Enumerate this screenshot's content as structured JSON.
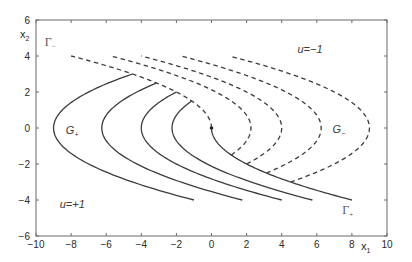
{
  "chart_data": {
    "type": "line",
    "title": "",
    "xlabel": "x1",
    "ylabel": "x2",
    "xlim": [
      -10,
      10
    ],
    "ylim": [
      -6,
      6
    ],
    "xticks": [
      -10,
      -8,
      -6,
      -4,
      -2,
      0,
      2,
      4,
      6,
      8,
      10
    ],
    "yticks": [
      -6,
      -4,
      -2,
      0,
      2,
      4,
      6
    ],
    "xtick_labels": [
      "-10",
      "-8",
      "-6",
      "-4",
      "-2",
      "0",
      "2",
      "4",
      "6",
      "8",
      "10"
    ],
    "ytick_labels": [
      "-6",
      "-4",
      "-2",
      "0",
      "2",
      "4",
      "6"
    ],
    "grid": false,
    "legend": null,
    "series": [
      {
        "name": "u=+1 trajectory (c=-9)",
        "style": "solid",
        "equation": "x1 = x2^2/2 + c",
        "c": -9,
        "x2_range": [
          -4,
          3
        ],
        "points": [
          [
            -1,
            -4
          ],
          [
            -2.875,
            -3.5
          ],
          [
            -4.5,
            -3
          ],
          [
            -5.875,
            -2.5
          ],
          [
            -7,
            -2
          ],
          [
            -7.875,
            -1.5
          ],
          [
            -8.5,
            -1
          ],
          [
            -8.875,
            -0.5
          ],
          [
            -9,
            0
          ],
          [
            -8.875,
            0.5
          ],
          [
            -8.5,
            1
          ],
          [
            -7.875,
            1.5
          ],
          [
            -7,
            2
          ],
          [
            -5.875,
            2.5
          ],
          [
            -4.5,
            3
          ]
        ]
      },
      {
        "name": "u=+1 trajectory (c=-6.25)",
        "style": "solid",
        "equation": "x1 = x2^2/2 + c",
        "c": -6.25,
        "x2_range": [
          -4,
          2.5
        ],
        "points": [
          [
            1.75,
            -4
          ],
          [
            -0.125,
            -3.5
          ],
          [
            -1.75,
            -3
          ],
          [
            -3.125,
            -2.5
          ],
          [
            -4.25,
            -2
          ],
          [
            -5.125,
            -1.5
          ],
          [
            -5.75,
            -1
          ],
          [
            -6.125,
            -0.5
          ],
          [
            -6.25,
            0
          ],
          [
            -6.125,
            0.5
          ],
          [
            -5.75,
            1
          ],
          [
            -5.125,
            1.5
          ],
          [
            -4.25,
            2
          ],
          [
            -3.125,
            2.5
          ]
        ]
      },
      {
        "name": "u=+1 trajectory (c=-4)",
        "style": "solid",
        "equation": "x1 = x2^2/2 + c",
        "c": -4,
        "x2_range": [
          -4,
          2
        ],
        "points": [
          [
            4,
            -4
          ],
          [
            2.125,
            -3.5
          ],
          [
            0.5,
            -3
          ],
          [
            -0.875,
            -2.5
          ],
          [
            -2,
            -2
          ],
          [
            -2.875,
            -1.5
          ],
          [
            -3.5,
            -1
          ],
          [
            -3.875,
            -0.5
          ],
          [
            -4,
            0
          ],
          [
            -3.875,
            0.5
          ],
          [
            -3.5,
            1
          ],
          [
            -2.875,
            1.5
          ],
          [
            -2,
            2
          ]
        ]
      },
      {
        "name": "u=+1 trajectory (c=-2.25)",
        "style": "solid",
        "equation": "x1 = x2^2/2 + c",
        "c": -2.25,
        "x2_range": [
          -4,
          1.5
        ],
        "points": [
          [
            5.75,
            -4
          ],
          [
            3.875,
            -3.5
          ],
          [
            2.25,
            -3
          ],
          [
            0.875,
            -2.5
          ],
          [
            -0.25,
            -2
          ],
          [
            -1.125,
            -1.5
          ],
          [
            -1.75,
            -1
          ],
          [
            -2.125,
            -0.5
          ],
          [
            -2.25,
            0
          ],
          [
            -2.125,
            0.5
          ],
          [
            -1.75,
            1
          ],
          [
            -1.125,
            1.5
          ]
        ]
      },
      {
        "name": "Gamma+ switching curve",
        "style": "solid",
        "equation": "x1 = x2^2/2 + c",
        "c": 0,
        "x2_range": [
          -4,
          0
        ],
        "points": [
          [
            8,
            -4
          ],
          [
            6.125,
            -3.5
          ],
          [
            4.5,
            -3
          ],
          [
            3.125,
            -2.5
          ],
          [
            2,
            -2
          ],
          [
            1.125,
            -1.5
          ],
          [
            0.5,
            -1
          ],
          [
            0.125,
            -0.5
          ],
          [
            0,
            0
          ]
        ]
      },
      {
        "name": "u=-1 trajectory (c=9)",
        "style": "dashed",
        "equation": "x1 = -x2^2/2 + c",
        "c": 9,
        "x2_range": [
          -3,
          4
        ],
        "points": [
          [
            4.5,
            -3
          ],
          [
            5.875,
            -2.5
          ],
          [
            7,
            -2
          ],
          [
            7.875,
            -1.5
          ],
          [
            8.5,
            -1
          ],
          [
            8.875,
            -0.5
          ],
          [
            9,
            0
          ],
          [
            8.875,
            0.5
          ],
          [
            8.5,
            1
          ],
          [
            7.875,
            1.5
          ],
          [
            7,
            2
          ],
          [
            5.875,
            2.5
          ],
          [
            4.5,
            3
          ],
          [
            2.875,
            3.5
          ],
          [
            1,
            4
          ]
        ]
      },
      {
        "name": "u=-1 trajectory (c=6.25)",
        "style": "dashed",
        "equation": "x1 = -x2^2/2 + c",
        "c": 6.25,
        "x2_range": [
          -2.5,
          4
        ],
        "points": [
          [
            3.125,
            -2.5
          ],
          [
            4.25,
            -2
          ],
          [
            5.125,
            -1.5
          ],
          [
            5.75,
            -1
          ],
          [
            6.125,
            -0.5
          ],
          [
            6.25,
            0
          ],
          [
            6.125,
            0.5
          ],
          [
            5.75,
            1
          ],
          [
            5.125,
            1.5
          ],
          [
            4.25,
            2
          ],
          [
            3.125,
            2.5
          ],
          [
            1.75,
            3
          ],
          [
            0.125,
            3.5
          ],
          [
            -1.75,
            4
          ]
        ]
      },
      {
        "name": "u=-1 trajectory (c=4)",
        "style": "dashed",
        "equation": "x1 = -x2^2/2 + c",
        "c": 4,
        "x2_range": [
          -2,
          4
        ],
        "points": [
          [
            2,
            -2
          ],
          [
            2.875,
            -1.5
          ],
          [
            3.5,
            -1
          ],
          [
            3.875,
            -0.5
          ],
          [
            4,
            0
          ],
          [
            3.875,
            0.5
          ],
          [
            3.5,
            1
          ],
          [
            2.875,
            1.5
          ],
          [
            2,
            2
          ],
          [
            0.875,
            2.5
          ],
          [
            -0.5,
            3
          ],
          [
            -2.125,
            3.5
          ],
          [
            -4,
            4
          ]
        ]
      },
      {
        "name": "u=-1 trajectory (c=2.25)",
        "style": "dashed",
        "equation": "x1 = -x2^2/2 + c",
        "c": 2.25,
        "x2_range": [
          -1.5,
          4
        ],
        "points": [
          [
            1.125,
            -1.5
          ],
          [
            1.75,
            -1
          ],
          [
            2.125,
            -0.5
          ],
          [
            2.25,
            0
          ],
          [
            2.125,
            0.5
          ],
          [
            1.75,
            1
          ],
          [
            1.125,
            1.5
          ],
          [
            0.25,
            2
          ],
          [
            -0.875,
            2.5
          ],
          [
            -2.25,
            3
          ],
          [
            -3.875,
            3.5
          ],
          [
            -5.75,
            4
          ]
        ]
      },
      {
        "name": "Gamma- switching curve",
        "style": "dashed",
        "equation": "x1 = -x2^2/2 + c",
        "c": 0,
        "x2_range": [
          0,
          4
        ],
        "points": [
          [
            0,
            0
          ],
          [
            -0.125,
            0.5
          ],
          [
            -0.5,
            1
          ],
          [
            -1.125,
            1.5
          ],
          [
            -2,
            2
          ],
          [
            -3.125,
            2.5
          ],
          [
            -4.5,
            3
          ],
          [
            -6.125,
            3.5
          ],
          [
            -8,
            4
          ]
        ]
      }
    ],
    "markers": [
      {
        "name": "origin",
        "x": 0,
        "y": 0
      }
    ],
    "annotations": [
      {
        "id": "gamma-minus",
        "base": "Γ",
        "sub": "−",
        "x": -9.5,
        "y": 4.55,
        "kind": "greek"
      },
      {
        "id": "u-minus-one",
        "text": "u=−1",
        "x": 4.9,
        "y": 4.15,
        "kind": "italic"
      },
      {
        "id": "g-plus",
        "base": "G",
        "sub": "+",
        "x": -8.3,
        "y": -0.35,
        "kind": "italic-sub"
      },
      {
        "id": "g-minus",
        "base": "G",
        "sub": "−",
        "x": 6.9,
        "y": -0.25,
        "kind": "italic-sub"
      },
      {
        "id": "u-plus-one",
        "text": "u=+1",
        "x": -8.65,
        "y": -4.45,
        "kind": "italic"
      },
      {
        "id": "gamma-plus",
        "base": "Γ",
        "sub": "+",
        "x": 7.45,
        "y": -4.75,
        "kind": "greek"
      }
    ]
  }
}
